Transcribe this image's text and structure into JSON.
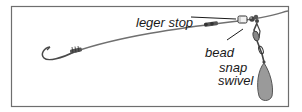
{
  "diagram": {
    "labels": {
      "leger_stop": "leger stop",
      "bead": "bead",
      "snap": "snap",
      "swivel": "swivel"
    },
    "components": [
      "hook",
      "knot",
      "line",
      "leger-stop",
      "bead",
      "snap-swivel",
      "lead-weight"
    ],
    "colors": {
      "frame": "#6e6e6e",
      "line": "#707070",
      "ink": "#1a1a1a",
      "weight_fill": "#9a9a9a"
    }
  }
}
